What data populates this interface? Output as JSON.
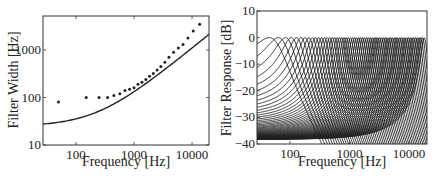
{
  "chart_data": [
    {
      "type": "scatter",
      "title": "",
      "xlabel": "Frequency [Hz]",
      "ylabel": "Filter Width [Hz]",
      "xscale": "log",
      "yscale": "log",
      "xlim": [
        27,
        19600
      ],
      "ylim": [
        10,
        5200
      ],
      "xticks": [
        100,
        1000,
        10000
      ],
      "xtick_labels": [
        "100",
        "1000",
        "10000"
      ],
      "yticks": [
        10,
        100,
        1000
      ],
      "ytick_labels": [
        "10",
        "100",
        "1000"
      ],
      "grid": false,
      "series": [
        {
          "name": "filter bandwidths (markers)",
          "style": "marker",
          "x": [
            50,
            150,
            250,
            350,
            450,
            570,
            700,
            840,
            1000,
            1170,
            1370,
            1600,
            1850,
            2150,
            2500,
            2900,
            3400,
            4000,
            4800,
            5800,
            7000,
            8500,
            10500,
            13500
          ],
          "y": [
            80,
            100,
            100,
            100,
            110,
            120,
            140,
            150,
            160,
            190,
            210,
            240,
            280,
            320,
            380,
            450,
            550,
            700,
            900,
            1100,
            1300,
            1800,
            2500,
            3500
          ]
        },
        {
          "name": "ERB curve",
          "style": "line",
          "x": [
            27,
            50,
            100,
            200,
            400,
            700,
            1000,
            2000,
            4000,
            7000,
            10000,
            19600
          ],
          "y": [
            27.6,
            30.1,
            35.5,
            46.3,
            68.0,
            100.4,
            132.7,
            240.6,
            456.5,
            780.3,
            1104.2,
            2140
          ]
        }
      ]
    },
    {
      "type": "line",
      "title": "",
      "xlabel": "Frequency [Hz]",
      "ylabel": "Filter Response [dB]",
      "xscale": "log",
      "xlim": [
        28,
        20000
      ],
      "ylim": [
        -40,
        10
      ],
      "xticks": [
        100,
        1000,
        10000
      ],
      "xtick_labels": [
        "100",
        "1000",
        "10000"
      ],
      "yticks": [
        10,
        0,
        -10,
        -20,
        -30,
        -40
      ],
      "ytick_labels": [
        "10",
        "0",
        "−10",
        "−20",
        "−30",
        "−40"
      ],
      "grid": false,
      "description": "Bank of overlapping bandpass filter responses (gammatone-like), each peaking at 0 dB, center frequencies from ~45 Hz to ~18 kHz",
      "series_count": 64,
      "peak_db": 0,
      "first_center_hz": 45,
      "last_center_hz": 18000
    }
  ]
}
